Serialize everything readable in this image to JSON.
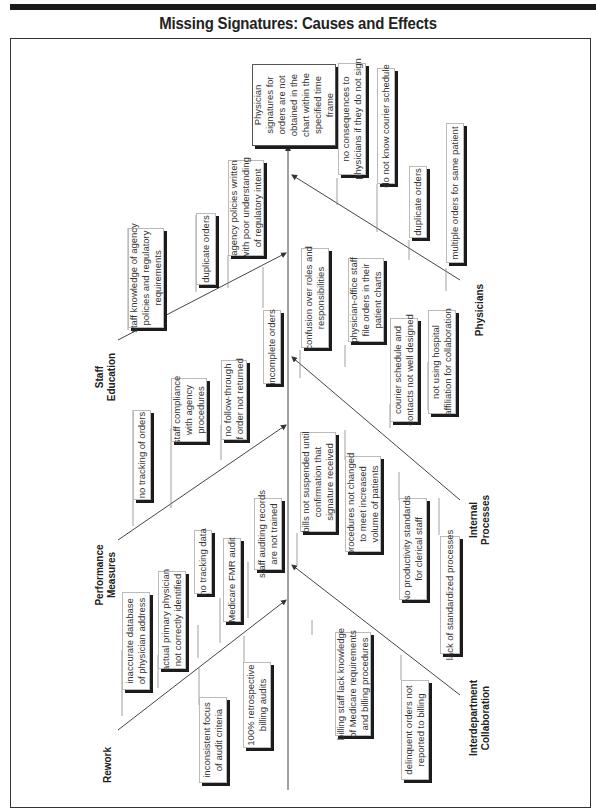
{
  "title": "Missing Signatures: Causes and Effects",
  "effect": "Physician\nsignatures for\norders are not\nobtained in the\nchart within the\nspecified time\nframe",
  "categories": {
    "staff_education": "Staff\nEducation",
    "performance_measures": "Performance\nMeasures",
    "rework": "Rework",
    "physicians": "Physicians",
    "internal_processes": "Internal\nProcesses",
    "interdepartment_collaboration": "Interdepartment\nCollaboration"
  },
  "causes": {
    "staff_education": [
      "staff knowledge of agency\npolicies and regulatory\nrequirements",
      "duplicate orders",
      "agency policies written\nwith poor understanding\nof regulatory intent",
      "incomplete orders"
    ],
    "performance_measures": [
      "no tracking of orders",
      "staff compliance\nwith agency\nprocedures",
      "no follow-through\nif order not returned"
    ],
    "rework": [
      "inaccurate database\nof physician address",
      "actual primary physician\nnot correctly identified",
      "no tracking data",
      "Medicare FMR audit",
      "staff auditing records\nare not trained",
      "inconsistent focus\nof audit criteria",
      "100% retrospective\nbilling audits"
    ],
    "physicians": [
      "no consequences to\nphysicians if they do not sign",
      "do not know courier schedule",
      "duplicate orders",
      "multiple orders for same patient"
    ],
    "internal_processes": [
      "confusion over roles and\nresponsibilities",
      "physician-office staff\nfile orders in their\npatient charts",
      "courier schedule and\ncontacts not well designed",
      "not using hospital\naffiliation for collaboration"
    ],
    "interdepartment_collaboration": [
      "bills not suspended until\nconfirmation that\nsignature received",
      "procedures not changed\nto meet increased\nvolume of patients",
      "No productivity standards\nfor clerical staff",
      "lack of standardized processes",
      "billing staff lack knowledge\nof Medicare requirements\nand billing procedures",
      "delinquent orders not\nreported to billing"
    ]
  }
}
